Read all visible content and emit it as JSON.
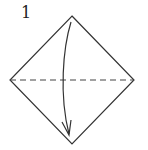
{
  "step": {
    "number": "1"
  },
  "diagram": {
    "shape": "square-diamond",
    "vertices": {
      "top": [
        72,
        16
      ],
      "right": [
        134,
        80
      ],
      "bottom": [
        72,
        144
      ],
      "left": [
        10,
        80
      ]
    },
    "fold_line": {
      "type": "valley-fold",
      "style": "dashed",
      "from": [
        10,
        80
      ],
      "to": [
        134,
        80
      ]
    },
    "arrow": {
      "direction": "top-to-bottom",
      "meaning": "fold top corner down to bottom corner"
    },
    "colors": {
      "line": "#333333",
      "background": "#ffffff"
    }
  }
}
